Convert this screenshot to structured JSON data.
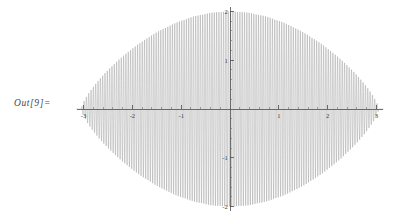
{
  "cell": {
    "out_label": "Out[9]="
  },
  "chart_data": {
    "type": "line",
    "title": "",
    "subtitle": "",
    "xlabel": "",
    "ylabel": "",
    "xlim": [
      -3.14,
      3.14
    ],
    "ylim": [
      -2.1,
      2.1
    ],
    "grid": false,
    "legend": null,
    "axes_style": "mathematica-crossed-axes",
    "x_ticks_major": [
      -3,
      -2,
      -1,
      1,
      2,
      3
    ],
    "x_tick_labels": [
      "-3",
      "-2",
      "-1",
      "1",
      "2",
      "3"
    ],
    "y_ticks_major": [
      -2,
      -1,
      1,
      2
    ],
    "y_tick_labels": [
      "-2",
      "-1",
      "1",
      "2"
    ],
    "x_minor_step": 0.2,
    "y_minor_step": 0.2,
    "curve_color": "#8f8f8f",
    "axis_color": "#4d4d4d",
    "background_color": "#ffffff",
    "series": [
      {
        "name": "damped-oscillation",
        "description": "High-frequency oscillation inside a lens-shaped amplitude envelope peaking at 2 near x=0 and tapering to 0 at x=+/-3",
        "envelope_peak": 2,
        "envelope_zero_x": 3.05,
        "oscillation_cycles": 128,
        "samples": 4200
      }
    ]
  }
}
